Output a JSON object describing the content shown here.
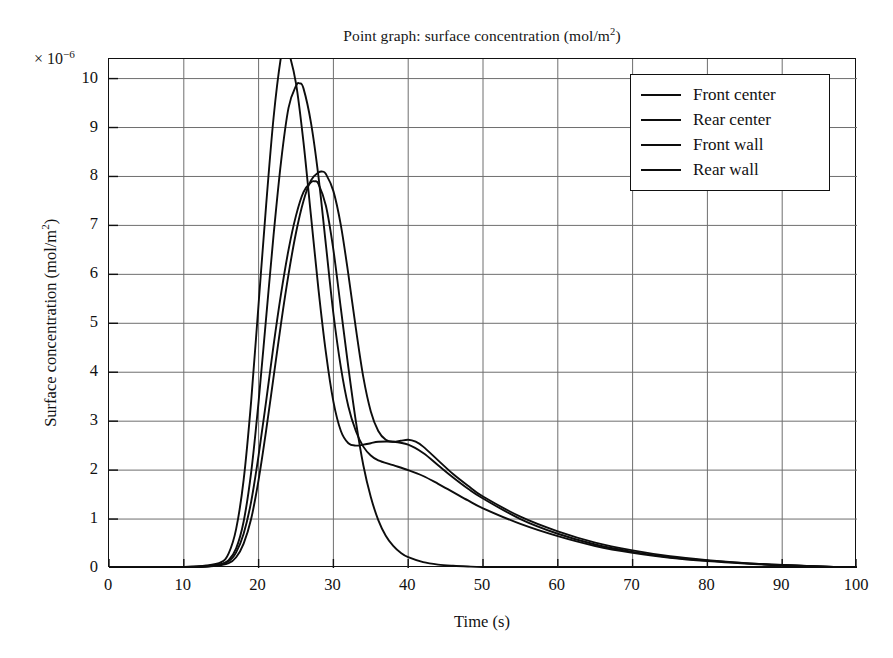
{
  "chart_data": {
    "type": "line",
    "title": "Point graph: surface concentration (mol/m2)",
    "title_main": "Point graph: surface concentration (mol/m",
    "title_sup": "2",
    "title_tail": ")",
    "xlabel": "Time (s)",
    "ylabel_main": "Surface concentration (mol/m",
    "ylabel_sup": "2",
    "ylabel_tail": ")",
    "ylabel": "Surface concentration (mol/m2)",
    "y_multiplier_prefix": "× 10",
    "y_multiplier_exponent": "−6",
    "y_multiplier": "× 10−6",
    "xlim": [
      0,
      100
    ],
    "ylim": [
      0,
      10.4
    ],
    "xticks": [
      0,
      10,
      20,
      30,
      40,
      50,
      60,
      70,
      80,
      90,
      100
    ],
    "yticks": [
      0,
      1,
      2,
      3,
      4,
      5,
      6,
      7,
      8,
      9,
      10
    ],
    "xtick_labels": [
      "0",
      "10",
      "20",
      "30",
      "40",
      "50",
      "60",
      "70",
      "80",
      "90",
      "100"
    ],
    "ytick_labels": [
      "0",
      "1",
      "2",
      "3",
      "4",
      "5",
      "6",
      "7",
      "8",
      "9",
      "10"
    ],
    "grid": true,
    "grid_color": "#6e6e6e",
    "line_color": "#0d0d0d",
    "legend_position": "upper right",
    "legend_entries": [
      "Front center",
      "Rear center",
      "Front wall",
      "Rear wall"
    ],
    "series": [
      {
        "name": "Front center",
        "peak_x": 23.5,
        "peak_y": 10.65,
        "x": [
          0,
          5,
          10,
          13,
          15,
          16,
          17,
          18,
          19,
          20,
          21,
          22,
          23,
          23.5,
          24,
          25,
          26,
          27,
          28,
          29,
          30,
          31,
          32,
          33,
          34,
          35,
          36,
          38,
          40,
          42,
          44,
          46,
          48,
          50,
          55,
          60,
          65,
          70,
          75,
          80,
          85,
          90,
          95,
          100
        ],
        "values": [
          0,
          0,
          0.02,
          0.05,
          0.12,
          0.3,
          0.8,
          1.8,
          3.4,
          5.4,
          7.4,
          9.2,
          10.45,
          10.65,
          10.55,
          9.9,
          8.7,
          7.2,
          5.7,
          4.4,
          3.4,
          2.8,
          2.55,
          2.5,
          2.52,
          2.55,
          2.58,
          2.58,
          2.52,
          2.35,
          2.1,
          1.85,
          1.62,
          1.42,
          1.0,
          0.7,
          0.48,
          0.33,
          0.22,
          0.15,
          0.1,
          0.06,
          0.03,
          0.01
        ]
      },
      {
        "name": "Rear center",
        "peak_x": 25.5,
        "peak_y": 9.9,
        "x": [
          0,
          5,
          10,
          13,
          15,
          16,
          17,
          18,
          19,
          20,
          21,
          22,
          23,
          24,
          25,
          25.5,
          26,
          27,
          28,
          29,
          30,
          31,
          32,
          33,
          34,
          35,
          36,
          38,
          40,
          42,
          44,
          46,
          48,
          50,
          55,
          60,
          65,
          70,
          75,
          80,
          85,
          90,
          95,
          100
        ],
        "values": [
          0,
          0,
          0.01,
          0.03,
          0.07,
          0.16,
          0.4,
          0.95,
          1.95,
          3.4,
          5.1,
          6.8,
          8.3,
          9.4,
          9.85,
          9.9,
          9.8,
          9.1,
          8.0,
          6.6,
          5.2,
          4.1,
          3.3,
          2.8,
          2.48,
          2.3,
          2.2,
          2.1,
          2.0,
          1.88,
          1.72,
          1.55,
          1.38,
          1.22,
          0.9,
          0.65,
          0.45,
          0.31,
          0.21,
          0.14,
          0.09,
          0.055,
          0.03,
          0.01
        ]
      },
      {
        "name": "Front wall",
        "peak_x": 28.5,
        "peak_y": 8.1,
        "shoulder_x": 40,
        "shoulder_y": 2.62,
        "x": [
          0,
          5,
          10,
          14,
          16,
          17,
          18,
          19,
          20,
          21,
          22,
          23,
          24,
          25,
          26,
          27,
          28,
          28.5,
          29,
          30,
          31,
          32,
          33,
          34,
          35,
          36,
          37,
          38,
          39,
          40,
          41,
          42,
          44,
          46,
          48,
          50,
          55,
          60,
          65,
          70,
          75,
          80,
          85,
          90,
          95,
          100
        ],
        "values": [
          0,
          0,
          0.01,
          0.04,
          0.1,
          0.22,
          0.5,
          1.0,
          1.8,
          2.8,
          3.9,
          5.0,
          6.0,
          6.85,
          7.5,
          7.92,
          8.08,
          8.1,
          8.05,
          7.7,
          7.0,
          6.0,
          4.9,
          3.9,
          3.2,
          2.8,
          2.62,
          2.58,
          2.6,
          2.62,
          2.58,
          2.48,
          2.2,
          1.92,
          1.68,
          1.46,
          1.05,
          0.75,
          0.52,
          0.36,
          0.24,
          0.16,
          0.1,
          0.06,
          0.03,
          0.01
        ]
      },
      {
        "name": "Rear wall",
        "peak_x": 27.5,
        "peak_y": 7.9,
        "x": [
          0,
          5,
          10,
          14,
          16,
          17,
          18,
          19,
          20,
          21,
          22,
          23,
          24,
          25,
          26,
          27,
          27.5,
          28,
          29,
          30,
          31,
          32,
          33,
          34,
          35,
          36,
          37,
          38,
          39,
          40,
          42,
          44,
          46,
          48,
          50,
          55,
          60,
          70,
          80,
          90,
          100
        ],
        "values": [
          0,
          0,
          0.01,
          0.05,
          0.14,
          0.32,
          0.7,
          1.35,
          2.3,
          3.4,
          4.55,
          5.6,
          6.5,
          7.2,
          7.68,
          7.88,
          7.9,
          7.85,
          7.4,
          6.5,
          5.3,
          4.1,
          3.0,
          2.1,
          1.45,
          0.98,
          0.66,
          0.45,
          0.31,
          0.22,
          0.12,
          0.07,
          0.045,
          0.03,
          0.02,
          0.01,
          0.005,
          0.003,
          0.002,
          0.001,
          0
        ]
      }
    ]
  }
}
